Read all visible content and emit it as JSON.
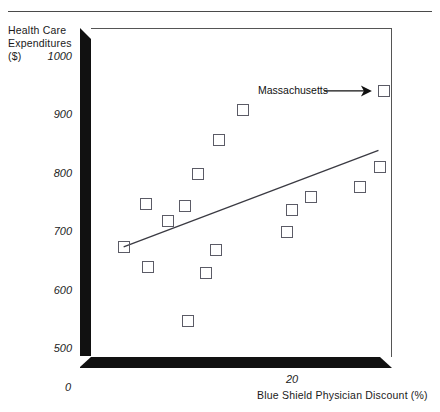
{
  "chart_data": {
    "type": "scatter",
    "title": "",
    "xlabel": "Blue Shield Physician Discount (%)",
    "ylabel": "Health Care Expenditures ($)",
    "ylabel_lines": [
      "Health Care",
      "Expenditures",
      "($)"
    ],
    "xticks": [
      "0",
      "20"
    ],
    "xtick_values": [
      0,
      20
    ],
    "yticks": [
      "0",
      "500",
      "600",
      "700",
      "800",
      "900",
      "1000"
    ],
    "ytick_values": [
      0,
      500,
      600,
      700,
      800,
      900,
      1000
    ],
    "ylim": [
      480,
      1020
    ],
    "xlim": [
      0,
      33
    ],
    "grid": false,
    "legend": false,
    "marker": "open-square",
    "points": [
      {
        "x": 1.5,
        "y": 672,
        "label": ""
      },
      {
        "x": 4.0,
        "y": 745,
        "label": ""
      },
      {
        "x": 4.2,
        "y": 638,
        "label": ""
      },
      {
        "x": 6.4,
        "y": 716,
        "label": ""
      },
      {
        "x": 8.2,
        "y": 742,
        "label": ""
      },
      {
        "x": 8.6,
        "y": 544,
        "label": ""
      },
      {
        "x": 9.7,
        "y": 797,
        "label": ""
      },
      {
        "x": 10.6,
        "y": 627,
        "label": ""
      },
      {
        "x": 11.6,
        "y": 667,
        "label": ""
      },
      {
        "x": 12.0,
        "y": 855,
        "label": ""
      },
      {
        "x": 14.6,
        "y": 908,
        "label": ""
      },
      {
        "x": 19.5,
        "y": 697,
        "label": ""
      },
      {
        "x": 20.0,
        "y": 735,
        "label": ""
      },
      {
        "x": 22.1,
        "y": 757,
        "label": ""
      },
      {
        "x": 27.5,
        "y": 775,
        "label": ""
      },
      {
        "x": 29.7,
        "y": 810,
        "label": ""
      },
      {
        "x": 30.1,
        "y": 940,
        "label": "Massachusetts"
      }
    ],
    "trendline": {
      "x0": 1.5,
      "y0": 672,
      "x1": 29.5,
      "y1": 838,
      "visible": true
    },
    "annotations": [
      {
        "text": "Massachusetts",
        "arrow": "right-arrow",
        "target_point_index": 16
      }
    ]
  },
  "axes": {
    "y_title_line1": "Health Care",
    "y_title_line2": "Expenditures",
    "y_title_line3": "($)",
    "x_title": "Blue Shield Physician Discount (%)",
    "y_tick_1000": "1000",
    "y_tick_900": "900",
    "y_tick_800": "800",
    "y_tick_700": "700",
    "y_tick_600": "600",
    "y_tick_500": "500",
    "origin_tick": "0",
    "x_tick_20": "20"
  },
  "annotation": {
    "massachusetts_label": "Massachusetts"
  },
  "colors": {
    "axis_slab": "#111111",
    "marker_stroke": "#5b5b66",
    "trendline": "#3a3a42",
    "frame": "#555555",
    "text": "#1a1a1a"
  }
}
